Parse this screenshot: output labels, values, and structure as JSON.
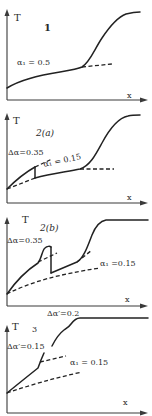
{
  "figure": {
    "type": "multi-panel schematic diagram",
    "panels": [
      {
        "id": "1",
        "label": "1",
        "y_axis_label": "T",
        "x_axis_label": "x",
        "annotations": [
          "α₁ = 0.5"
        ],
        "curves": [
          {
            "style": "solid",
            "description": "gradual rise then steep S-shaped rise to plateau"
          },
          {
            "style": "dashed",
            "description": "continuation of slow branch"
          }
        ]
      },
      {
        "id": "2a",
        "label": "2(a)",
        "y_axis_label": "T",
        "x_axis_label": "x",
        "annotations": [
          "Δα=0.35",
          "α₁ = 0.15"
        ],
        "curves": [
          {
            "style": "solid",
            "description": "rise, vertical drop, slow rise then S-shaped rise to plateau"
          },
          {
            "style": "dashed",
            "description": "upper branch continuation after drop"
          },
          {
            "style": "dashed",
            "description": "lower initial branch"
          },
          {
            "style": "dashed",
            "description": "continuation of slow branch"
          }
        ]
      },
      {
        "id": "2b",
        "label": "2(b)",
        "y_axis_label": "T",
        "x_axis_label": "x",
        "annotations": [
          "Δα=0.35",
          "α₁ =0.15",
          "Δα′=0.2"
        ],
        "curves": [
          {
            "style": "solid",
            "description": "rise with bump, vertical drop, rise then S-shaped rise to plateau"
          },
          {
            "style": "dashed",
            "description": "upper branch after bump"
          },
          {
            "style": "dashed",
            "description": "branch labeled α₁"
          },
          {
            "style": "dashed",
            "description": "lower baseline branch"
          }
        ]
      },
      {
        "id": "3",
        "label": "3",
        "y_axis_label": "T",
        "x_axis_label": "x",
        "annotations": [
          "Δα′=0.15",
          "α₁ = 0.15"
        ],
        "curves": [
          {
            "style": "solid",
            "description": "rise with successive steps to plateau"
          },
          {
            "style": "dashed",
            "description": "branch labeled α₁"
          },
          {
            "style": "dashed",
            "description": "lower baseline branch"
          }
        ]
      }
    ]
  },
  "labels": {
    "p1_title": "1",
    "p1_T": "T",
    "p1_x": "x",
    "p1_alpha": "α₁ = 0.5",
    "p2a_title": "2(a)",
    "p2a_T": "T",
    "p2a_x": "x",
    "p2a_dalpha": "Δα=0.35",
    "p2a_alpha": "α₁ = 0.15",
    "p2b_title": "2(b)",
    "p2b_T": "T",
    "p2b_x": "x",
    "p2b_dalpha": "Δα=0.35",
    "p2b_alpha": "α₁ =0.15",
    "p2b_dalpha_prime": "Δα′=0.2",
    "p3_title": "3",
    "p3_T": "T",
    "p3_x": "x",
    "p3_dalpha_prime": "Δα′=0.15",
    "p3_alpha": "α₁ = 0.15"
  },
  "colors": {
    "background": "#ffffff",
    "line": "#222222",
    "axis": "#3a3a3a"
  }
}
